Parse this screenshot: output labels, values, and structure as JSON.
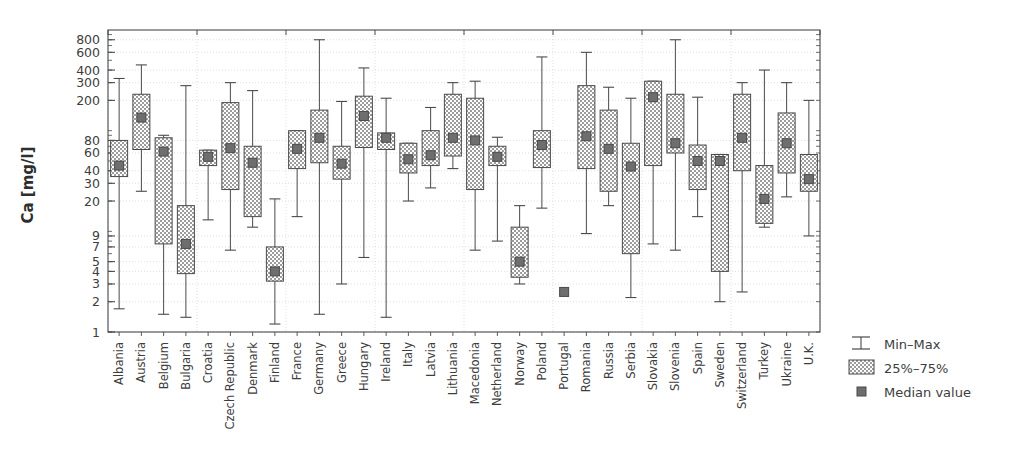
{
  "chart_data": {
    "type": "box",
    "title": "",
    "xlabel": "",
    "ylabel": "Ca [mg/l]",
    "yscale": "log",
    "ylim": [
      1,
      1000
    ],
    "grid": true,
    "ytick_labels": [
      "800",
      "600",
      "400",
      "300",
      "200",
      "80",
      "60",
      "40",
      "30",
      "20",
      "9",
      "7",
      "5",
      "4",
      "3",
      "2",
      "1"
    ],
    "ytick_values": [
      800,
      600,
      400,
      300,
      200,
      80,
      60,
      40,
      30,
      20,
      9,
      7,
      5,
      4,
      3,
      2,
      1
    ],
    "categories": [
      "Albania",
      "Austria",
      "Belgium",
      "Bulgaria",
      "Croatia",
      "Czech Republic",
      "Denmark",
      "Finland",
      "France",
      "Germany",
      "Greece",
      "Hungary",
      "Ireland",
      "Italy",
      "Latvia",
      "Lithuania",
      "Macedonia",
      "Netherland",
      "Norway",
      "Poland",
      "Portugal",
      "Romania",
      "Russia",
      "Serbia",
      "Slovakia",
      "Slovenia",
      "Spain",
      "Sweden",
      "Switzerland",
      "Turkey",
      "Ukraine",
      "U.K."
    ],
    "series": [
      {
        "name": "Albania",
        "min": 1.7,
        "q1": 35,
        "median": 45,
        "q3": 80,
        "max": 330
      },
      {
        "name": "Austria",
        "min": 25,
        "q1": 65,
        "median": 135,
        "q3": 230,
        "max": 450
      },
      {
        "name": "Belgium",
        "min": 1.5,
        "q1": 7.5,
        "median": 62,
        "q3": 85,
        "max": 90
      },
      {
        "name": "Bulgaria",
        "min": 1.4,
        "q1": 3.8,
        "median": 7.5,
        "q3": 18,
        "max": 280
      },
      {
        "name": "Croatia",
        "min": 13,
        "q1": 45,
        "median": 55,
        "q3": 64,
        "max": 64
      },
      {
        "name": "Czech Republic",
        "min": 6.5,
        "q1": 26,
        "median": 67,
        "q3": 190,
        "max": 300
      },
      {
        "name": "Denmark",
        "min": 11,
        "q1": 14,
        "median": 48,
        "q3": 70,
        "max": 250
      },
      {
        "name": "Finland",
        "min": 1.2,
        "q1": 3.2,
        "median": 4.0,
        "q3": 7.0,
        "max": 21
      },
      {
        "name": "France",
        "min": 14,
        "q1": 42,
        "median": 66,
        "q3": 100,
        "max": 100
      },
      {
        "name": "Germany",
        "min": 1.5,
        "q1": 48,
        "median": 85,
        "q3": 160,
        "max": 800
      },
      {
        "name": "Greece",
        "min": 3.0,
        "q1": 33,
        "median": 47,
        "q3": 70,
        "max": 195
      },
      {
        "name": "Hungary",
        "min": 5.5,
        "q1": 68,
        "median": 140,
        "q3": 220,
        "max": 420
      },
      {
        "name": "Ireland",
        "min": 1.4,
        "q1": 65,
        "median": 85,
        "q3": 95,
        "max": 210
      },
      {
        "name": "Italy",
        "min": 20,
        "q1": 38,
        "median": 52,
        "q3": 75,
        "max": 75
      },
      {
        "name": "Latvia",
        "min": 27,
        "q1": 45,
        "median": 57,
        "q3": 100,
        "max": 170
      },
      {
        "name": "Lithuania",
        "min": 42,
        "q1": 56,
        "median": 85,
        "q3": 230,
        "max": 300
      },
      {
        "name": "Macedonia",
        "min": 6.5,
        "q1": 26,
        "median": 80,
        "q3": 210,
        "max": 310
      },
      {
        "name": "Netherland",
        "min": 8.0,
        "q1": 45,
        "median": 55,
        "q3": 70,
        "max": 86
      },
      {
        "name": "Norway",
        "min": 3.0,
        "q1": 3.5,
        "median": 5.0,
        "q3": 11,
        "max": 18
      },
      {
        "name": "Poland",
        "min": 17,
        "q1": 43,
        "median": 72,
        "q3": 100,
        "max": 540
      },
      {
        "name": "Portugal",
        "min": 2.5,
        "q1": 2.5,
        "median": 2.5,
        "q3": 2.5,
        "max": 2.5
      },
      {
        "name": "Romania",
        "min": 9.5,
        "q1": 42,
        "median": 88,
        "q3": 280,
        "max": 600
      },
      {
        "name": "Russia",
        "min": 18,
        "q1": 25,
        "median": 66,
        "q3": 160,
        "max": 270
      },
      {
        "name": "Serbia",
        "min": 2.2,
        "q1": 6.0,
        "median": 44,
        "q3": 75,
        "max": 210
      },
      {
        "name": "Slovakia",
        "min": 7.5,
        "q1": 45,
        "median": 215,
        "q3": 310,
        "max": 310
      },
      {
        "name": "Slovenia",
        "min": 6.5,
        "q1": 60,
        "median": 75,
        "q3": 230,
        "max": 800
      },
      {
        "name": "Spain",
        "min": 14,
        "q1": 26,
        "median": 50,
        "q3": 72,
        "max": 215
      },
      {
        "name": "Sweden",
        "min": 2.0,
        "q1": 4.0,
        "median": 50,
        "q3": 58,
        "max": 58
      },
      {
        "name": "Switzerland",
        "min": 2.5,
        "q1": 40,
        "median": 85,
        "q3": 230,
        "max": 300
      },
      {
        "name": "Turkey",
        "min": 11,
        "q1": 12,
        "median": 21,
        "q3": 45,
        "max": 400
      },
      {
        "name": "Ukraine",
        "min": 22,
        "q1": 38,
        "median": 75,
        "q3": 150,
        "max": 300
      },
      {
        "name": "U.K.",
        "min": 9.0,
        "q1": 25,
        "median": 33,
        "q3": 58,
        "max": 200
      }
    ],
    "legend": {
      "position": "right-bottom",
      "entries": [
        {
          "key": "min-max",
          "label": "Min–Max",
          "marker": "whisker-bar-icon"
        },
        {
          "key": "quartiles",
          "label": "25%–75%",
          "marker": "hatched-box-icon"
        },
        {
          "key": "median",
          "label": "Median value",
          "marker": "median-square-icon"
        }
      ]
    },
    "colors": {
      "axis": "#4a4a4a",
      "grid": "#c9c9c9",
      "box_fill": "#b9b9b9",
      "box_edge": "#4a4a4a",
      "whisker": "#4a4a4a",
      "median": "#6e6e6e",
      "text": "#3d3d3d",
      "background": "#ffffff"
    }
  }
}
